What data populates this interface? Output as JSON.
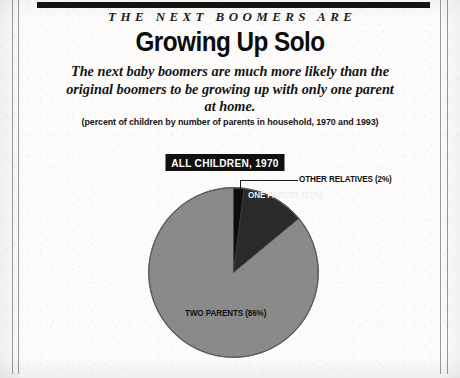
{
  "document": {
    "eyebrow": "THE NEXT BOOMERS ARE",
    "headline": "Growing Up Solo",
    "deck_line1": "The next baby boomers are much more likely than the",
    "deck_line2": "original boomers to be growing up with only one parent",
    "deck_line3": "at home.",
    "caption": "(percent of children by number of parents in household, 1970 and 1993)"
  },
  "chart_data": {
    "type": "pie",
    "title": "ALL CHILDREN, 1970",
    "categories": [
      "Two parents",
      "One parent",
      "Other relatives"
    ],
    "values": [
      86,
      12,
      2
    ],
    "labels": [
      "TWO PARENTS (86%)",
      "ONE PARENT (12%)",
      "OTHER RELATIVES (2%)"
    ],
    "colors": [
      "#8a8a8a",
      "#2a2a2a",
      "#0d0d0d"
    ],
    "units": "percent",
    "legend": "none",
    "grid": false,
    "start_angle_deg": 0,
    "direction": "clockwise"
  },
  "colors": {
    "ink": "#111111",
    "paper": "#fdfcfa",
    "pie_gray": "#8a8a8a",
    "pie_dark": "#2a2a2a",
    "pie_black": "#0d0d0d",
    "rule": "#9a9a9a"
  }
}
